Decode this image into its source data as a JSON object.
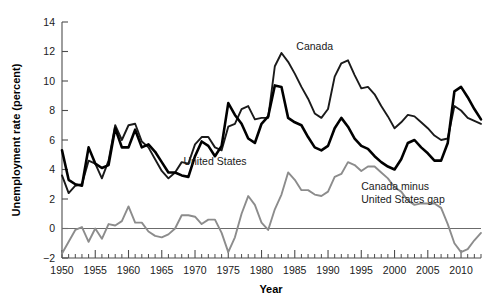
{
  "chart_data": {
    "type": "line",
    "title": "",
    "xlabel": "Year",
    "ylabel": "Unemployment rate (percent)",
    "xlim": [
      1950,
      2013
    ],
    "ylim": [
      -2,
      14
    ],
    "yticks": [
      -2,
      0,
      2,
      4,
      6,
      8,
      10,
      12,
      14
    ],
    "xticks": [
      1950,
      1955,
      1960,
      1965,
      1970,
      1975,
      1980,
      1985,
      1990,
      1995,
      2000,
      2005,
      2010
    ],
    "xtick_minor_step": 1,
    "grid": false,
    "legend": "inline-annotations",
    "zero_reference_line": 0,
    "x": [
      1950,
      1951,
      1952,
      1953,
      1954,
      1955,
      1956,
      1957,
      1958,
      1959,
      1960,
      1961,
      1962,
      1963,
      1964,
      1965,
      1966,
      1967,
      1968,
      1969,
      1970,
      1971,
      1972,
      1973,
      1974,
      1975,
      1976,
      1977,
      1978,
      1979,
      1980,
      1981,
      1982,
      1983,
      1984,
      1985,
      1986,
      1987,
      1988,
      1989,
      1990,
      1991,
      1992,
      1993,
      1994,
      1995,
      1996,
      1997,
      1998,
      1999,
      2000,
      2001,
      2002,
      2003,
      2004,
      2005,
      2006,
      2007,
      2008,
      2009,
      2010,
      2011,
      2012,
      2013
    ],
    "series": [
      {
        "name": "Canada",
        "color": "#1a1a1a",
        "label_x": 1988,
        "label_y": 12.1,
        "values": [
          3.6,
          2.4,
          2.9,
          3.0,
          4.6,
          4.4,
          3.4,
          4.6,
          7.0,
          6.0,
          7.0,
          7.1,
          5.9,
          5.5,
          4.7,
          3.9,
          3.4,
          3.8,
          4.5,
          4.4,
          5.7,
          6.2,
          6.2,
          5.5,
          5.3,
          6.9,
          7.1,
          8.1,
          8.3,
          7.4,
          7.5,
          7.5,
          11.0,
          11.9,
          11.3,
          10.5,
          9.6,
          8.8,
          7.8,
          7.5,
          8.1,
          10.3,
          11.2,
          11.4,
          10.4,
          9.5,
          9.6,
          9.1,
          8.3,
          7.6,
          6.8,
          7.2,
          7.7,
          7.6,
          7.2,
          6.8,
          6.3,
          6.0,
          6.1,
          8.3,
          8.0,
          7.5,
          7.3,
          7.1
        ]
      },
      {
        "name": "United States",
        "color": "#000000",
        "label_x": 1973,
        "label_y": 4.3,
        "values": [
          5.3,
          3.3,
          3.0,
          2.9,
          5.5,
          4.4,
          4.1,
          4.3,
          6.8,
          5.5,
          5.5,
          6.7,
          5.5,
          5.7,
          5.2,
          4.5,
          3.8,
          3.8,
          3.6,
          3.5,
          4.9,
          5.9,
          5.6,
          4.9,
          5.6,
          8.5,
          7.7,
          7.1,
          6.1,
          5.8,
          7.1,
          7.6,
          9.7,
          9.6,
          7.5,
          7.2,
          7.0,
          6.2,
          5.5,
          5.3,
          5.6,
          6.8,
          7.5,
          6.9,
          6.1,
          5.6,
          5.4,
          4.9,
          4.5,
          4.2,
          4.0,
          4.7,
          5.8,
          6.0,
          5.5,
          5.1,
          4.6,
          4.6,
          5.8,
          9.3,
          9.6,
          8.9,
          8.1,
          7.4
        ]
      },
      {
        "name": "Canada minus United States gap",
        "color": "#8c8c8c",
        "label_x": 1995,
        "label_y": 2.6,
        "values": [
          -1.7,
          -0.9,
          -0.1,
          0.1,
          -0.9,
          0.0,
          -0.7,
          0.3,
          0.2,
          0.5,
          1.5,
          0.4,
          0.4,
          -0.2,
          -0.5,
          -0.6,
          -0.4,
          0.0,
          0.9,
          0.9,
          0.8,
          0.3,
          0.6,
          0.6,
          -0.3,
          -1.6,
          -0.6,
          1.0,
          2.2,
          1.6,
          0.4,
          -0.1,
          1.3,
          2.3,
          3.8,
          3.3,
          2.6,
          2.6,
          2.3,
          2.2,
          2.5,
          3.5,
          3.7,
          4.5,
          4.3,
          3.9,
          4.2,
          4.2,
          3.8,
          3.4,
          2.8,
          2.5,
          1.9,
          1.6,
          1.7,
          1.7,
          1.7,
          1.4,
          0.3,
          -1.0,
          -1.6,
          -1.4,
          -0.8,
          -0.3
        ]
      }
    ]
  },
  "labels": {
    "canada": "Canada",
    "united_states": "United States",
    "gap_line1": "Canada minus",
    "gap_line2": "United States gap",
    "x_axis_title": "Year",
    "y_axis_title": "Unemployment rate (percent)"
  },
  "ytick_labels": [
    "14",
    "12",
    "10",
    "8",
    "6",
    "4",
    "2",
    "0",
    "−2"
  ],
  "xtick_labels": [
    "1950",
    "1955",
    "1960",
    "1965",
    "1970",
    "1975",
    "1980",
    "1985",
    "1990",
    "1995",
    "2000",
    "2005",
    "2010"
  ],
  "colors": {
    "canada": "#1a1a1a",
    "united_states": "#000000",
    "gap": "#8c8c8c",
    "axis": "#4d4d4d",
    "background": "#ffffff"
  }
}
